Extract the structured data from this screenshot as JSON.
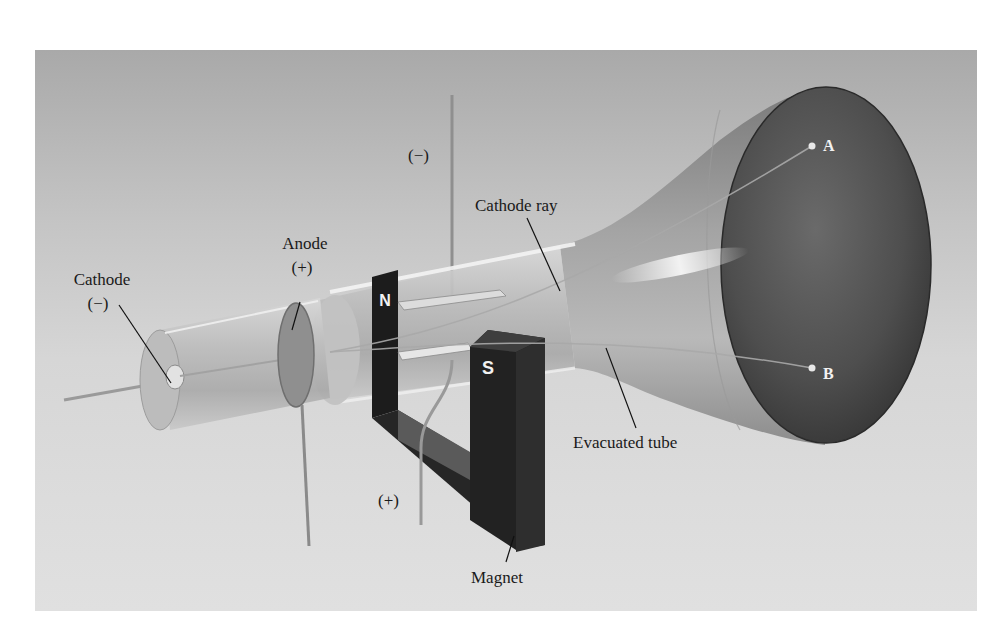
{
  "figure": {
    "labels": {
      "cathode": "Cathode",
      "cathode_sign": "(−)",
      "anode": "Anode",
      "anode_sign": "(+)",
      "top_plate_sign": "(−)",
      "bottom_plate_sign": "(+)",
      "cathode_ray": "Cathode ray",
      "evacuated_tube": "Evacuated tube",
      "magnet": "Magnet",
      "magnet_north": "N",
      "magnet_south": "S",
      "point_a": "A",
      "point_b": "B"
    },
    "colors": {
      "background_top": "#a9a9a9",
      "background_bottom": "#e0e0e0",
      "magnet": "#1c1c1c",
      "screen": "#4a4a4a",
      "label_text": "#1a1a1a"
    }
  }
}
